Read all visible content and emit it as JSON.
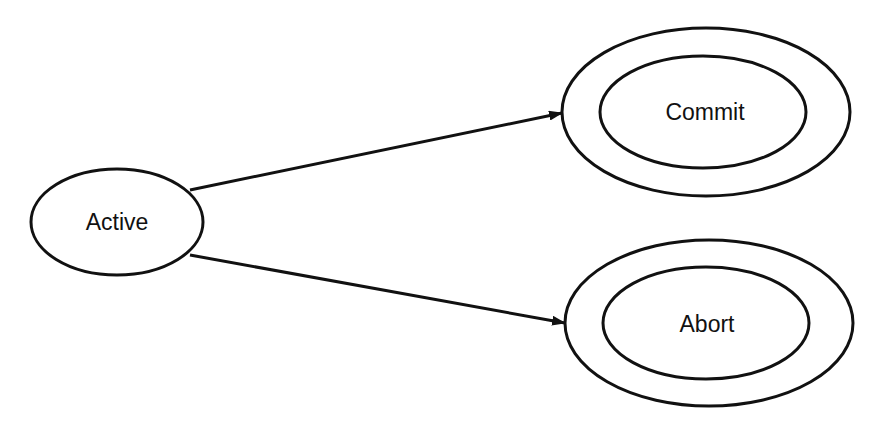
{
  "diagram": {
    "type": "state-diagram",
    "states": [
      {
        "id": "active",
        "label": "Active",
        "final": false
      },
      {
        "id": "commit",
        "label": "Commit",
        "final": true
      },
      {
        "id": "abort",
        "label": "Abort",
        "final": true
      }
    ],
    "transitions": [
      {
        "from": "Active",
        "to": "Commit"
      },
      {
        "from": "Active",
        "to": "Abort"
      }
    ],
    "colors": {
      "stroke": "#111111",
      "background": "#ffffff"
    }
  }
}
